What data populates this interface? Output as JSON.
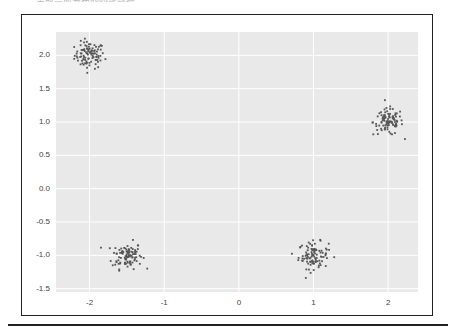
{
  "header": {
    "text": "生成高斯分布的四簇数据"
  },
  "chart_data": {
    "type": "scatter",
    "title": "",
    "xlabel": "",
    "ylabel": "",
    "xlim": [
      -2.45,
      2.4
    ],
    "ylim": [
      -1.55,
      2.35
    ],
    "grid": true,
    "legend": null,
    "xticks": [
      -2,
      -1,
      0,
      1,
      2
    ],
    "yticks": [
      2.0,
      1.5,
      1.0,
      0.5,
      0.0,
      -0.5,
      -1.0,
      -1.5
    ],
    "xtick_labels": [
      "-2",
      "-1",
      "0",
      "1",
      "2"
    ],
    "ytick_labels": [
      "2.0",
      "1.5",
      "1.0",
      "0.5",
      "0.0",
      "-0.5",
      "-1.0",
      "-1.5"
    ],
    "series": [
      {
        "name": "cluster-1",
        "center": [
          -2.0,
          2.0
        ],
        "std": 0.1,
        "n": 100
      },
      {
        "name": "cluster-2",
        "center": [
          -1.5,
          -1.0
        ],
        "std": 0.1,
        "n": 100
      },
      {
        "name": "cluster-3",
        "center": [
          1.0,
          -1.0
        ],
        "std": 0.1,
        "n": 100
      },
      {
        "name": "cluster-4",
        "center": [
          2.0,
          1.0
        ],
        "std": 0.1,
        "n": 100
      }
    ],
    "colors": {
      "background": "#e9e9e9",
      "grid": "#ffffff",
      "points": "#555555"
    }
  }
}
